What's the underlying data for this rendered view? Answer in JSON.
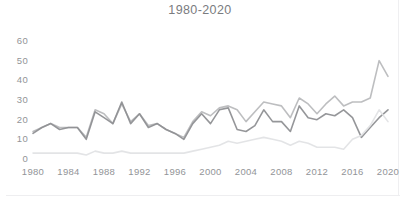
{
  "chart_data": {
    "type": "line",
    "title": "1980-2020",
    "xlabel": "",
    "ylabel": "",
    "xlim": [
      1980,
      2020
    ],
    "ylim": [
      0,
      60
    ],
    "grid": false,
    "legend": "none",
    "xticks": [
      "1980",
      "1984",
      "1988",
      "1992",
      "1996",
      "2000",
      "2004",
      "2008",
      "2012",
      "2016",
      "2020"
    ],
    "yticks": [
      "60",
      "50",
      "40",
      "30",
      "20",
      "10",
      "0"
    ],
    "x": [
      1980,
      1981,
      1982,
      1983,
      1984,
      1985,
      1986,
      1987,
      1988,
      1989,
      1990,
      1991,
      1992,
      1993,
      1994,
      1995,
      1996,
      1997,
      1998,
      1999,
      2000,
      2001,
      2002,
      2003,
      2004,
      2005,
      2006,
      2007,
      2008,
      2009,
      2010,
      2011,
      2012,
      2013,
      2014,
      2015,
      2016,
      2017,
      2018,
      2019,
      2020
    ],
    "series": [
      {
        "name": "series-upper",
        "color": "#b9babd",
        "values": [
          14,
          16,
          18,
          16,
          16,
          16,
          11,
          25,
          23,
          18,
          28,
          19,
          23,
          17,
          18,
          15,
          13,
          11,
          19,
          24,
          22,
          26,
          27,
          25,
          19,
          24,
          29,
          28,
          27,
          21,
          31,
          28,
          23,
          28,
          32,
          27,
          29,
          29,
          31,
          50,
          42
        ]
      },
      {
        "name": "series-middle",
        "color": "#8f9094",
        "values": [
          13,
          16,
          18,
          15,
          16,
          16,
          10,
          24,
          21,
          18,
          29,
          18,
          23,
          16,
          18,
          15,
          13,
          10,
          18,
          23,
          18,
          25,
          26,
          15,
          14,
          17,
          25,
          19,
          19,
          14,
          27,
          21,
          20,
          23,
          22,
          25,
          21,
          11,
          16,
          21,
          25
        ]
      },
      {
        "name": "series-lower",
        "color": "#e2e3e5",
        "values": [
          3,
          3,
          3,
          3,
          3,
          3,
          2,
          4,
          3,
          3,
          4,
          3,
          3,
          3,
          3,
          3,
          3,
          3,
          4,
          5,
          6,
          7,
          9,
          8,
          9,
          10,
          11,
          10,
          9,
          7,
          9,
          8,
          6,
          6,
          6,
          5,
          10,
          12,
          17,
          25,
          19
        ]
      }
    ]
  },
  "colors": {
    "background": "#ffffff",
    "title_text": "#6f7175",
    "tick_text": "#8d8f93",
    "card_edge": "#efeff1"
  }
}
